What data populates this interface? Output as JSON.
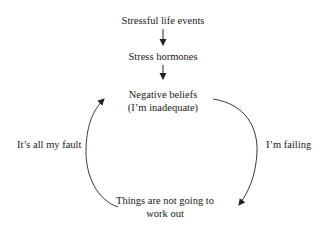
{
  "diagram": {
    "type": "cycle-flowchart",
    "nodes": {
      "stressful_life_events": {
        "label": "Stressful life events"
      },
      "stress_hormones": {
        "label": "Stress hormones"
      },
      "negative_beliefs": {
        "line1": "Negative beliefs",
        "line2": "(I’m inadequate)"
      },
      "things_not_work_out": {
        "line1": "Things are not going to",
        "line2": "work out"
      }
    },
    "edges": [
      {
        "from": "stressful_life_events",
        "to": "stress_hormones",
        "label": ""
      },
      {
        "from": "stress_hormones",
        "to": "negative_beliefs",
        "label": ""
      },
      {
        "from": "negative_beliefs",
        "to": "things_not_work_out",
        "label": "I’m failing"
      },
      {
        "from": "things_not_work_out",
        "to": "negative_beliefs",
        "label": "It’s all my fault"
      }
    ],
    "edge_labels": {
      "right": "I’m failing",
      "left": "It’s all my fault"
    },
    "colors": {
      "text": "#1a1a1a",
      "line": "#222222",
      "background": "#ffffff"
    }
  }
}
